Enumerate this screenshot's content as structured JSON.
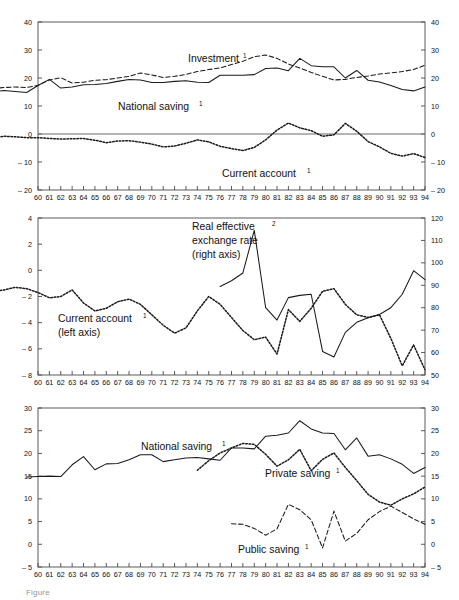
{
  "figure": {
    "caption": "Figure",
    "x_axis_tick_labels": [
      "60",
      "61",
      "62",
      "63",
      "64",
      "65",
      "66",
      "67",
      "68",
      "69",
      "70",
      "71",
      "72",
      "73",
      "74",
      "75",
      "76",
      "77",
      "78",
      "79",
      "80",
      "81",
      "82",
      "83",
      "84",
      "85",
      "86",
      "87",
      "88",
      "89",
      "90",
      "91",
      "92",
      "93",
      "94"
    ],
    "footnote_marker_1": "1",
    "footnote_marker_2": "2"
  },
  "chart_data": [
    {
      "type": "line",
      "panel": "top",
      "title": "",
      "xlabel": "",
      "ylabel": "",
      "x": [
        1960,
        1961,
        1962,
        1963,
        1964,
        1965,
        1966,
        1967,
        1968,
        1969,
        1970,
        1971,
        1972,
        1973,
        1974,
        1975,
        1976,
        1977,
        1978,
        1979,
        1980,
        1981,
        1982,
        1983,
        1984,
        1985,
        1986,
        1987,
        1988,
        1989,
        1990,
        1991,
        1992,
        1993,
        1994
      ],
      "xtick_labels": [
        "60",
        "61",
        "62",
        "63",
        "64",
        "65",
        "66",
        "67",
        "68",
        "69",
        "70",
        "71",
        "72",
        "73",
        "74",
        "75",
        "76",
        "77",
        "78",
        "79",
        "80",
        "81",
        "82",
        "83",
        "84",
        "85",
        "86",
        "87",
        "88",
        "89",
        "90",
        "91",
        "92",
        "93",
        "94"
      ],
      "ylim": [
        -20,
        40
      ],
      "yticks": [
        -20,
        -10,
        0,
        10,
        20,
        30,
        40
      ],
      "ytick_labels": [
        "– 20",
        "– 10",
        "0",
        "10",
        "20",
        "30",
        "40"
      ],
      "right_axis_yticks": [
        -20,
        -10,
        0,
        10,
        20,
        30,
        40
      ],
      "right_axis_tick_labels": [
        "– 20",
        "– 10",
        "0",
        "10",
        "20",
        "30",
        "40"
      ],
      "grid": false,
      "zero_line": true,
      "series": [
        {
          "name": "Investment",
          "label": "Investment",
          "label_superscript": "1",
          "style": "dashed",
          "color": "#1a1a1a",
          "values": [
            16.2,
            16.6,
            16.8,
            16.6,
            17.4,
            19.3,
            20.1,
            18.2,
            18.5,
            19.2,
            19.4,
            20.0,
            20.6,
            21.8,
            21.1,
            20.2,
            20.6,
            21.3,
            22.3,
            23.0,
            23.6,
            24.8,
            26.0,
            27.6,
            28.2,
            27.0,
            25.0,
            23.6,
            22.0,
            20.6,
            19.3,
            19.5,
            20.2,
            20.7,
            21.4,
            21.8,
            22.3,
            23.0,
            24.6
          ]
        },
        {
          "name": "National saving",
          "label": "National saving",
          "label_superscript": "1",
          "style": "solid",
          "color": "#1a1a1a",
          "values": [
            14.9,
            15.1,
            15.5,
            15.2,
            14.8,
            17.3,
            19.5,
            16.4,
            16.8,
            17.6,
            17.7,
            18.0,
            18.8,
            19.5,
            19.3,
            18.4,
            18.4,
            18.8,
            19.0,
            18.5,
            18.4,
            21.0,
            21.0,
            21.0,
            21.2,
            23.4,
            23.6,
            22.6,
            27.0,
            24.4,
            24.0,
            24.0,
            20.0,
            22.7,
            19.2,
            18.6,
            17.3,
            15.9,
            15.4,
            16.8
          ]
        },
        {
          "name": "Current account",
          "label": "Current account",
          "label_superscript": "1",
          "style": "dotted",
          "color": "#1a1a1a",
          "values": [
            -2.2,
            -2.0,
            -1.8,
            -1.4,
            -0.8,
            -1.0,
            -1.3,
            -1.3,
            -1.6,
            -1.8,
            -1.7,
            -1.6,
            -2.2,
            -3.1,
            -2.5,
            -2.4,
            -2.9,
            -3.6,
            -4.6,
            -4.3,
            -3.3,
            -2.1,
            -2.8,
            -4.4,
            -5.2,
            -5.9,
            -4.8,
            -2.1,
            1.4,
            3.9,
            2.2,
            1.2,
            -0.8,
            -0.3,
            3.8,
            1.0,
            -2.7,
            -4.6,
            -6.9,
            -7.9,
            -7.0,
            -8.4
          ]
        }
      ]
    },
    {
      "type": "line",
      "panel": "middle",
      "title": "",
      "xlabel": "",
      "ylabel": "",
      "ylim": [
        -8,
        4
      ],
      "yticks": [
        -8,
        -6,
        -4,
        -2,
        0,
        2,
        4
      ],
      "ytick_labels": [
        "– 8",
        "– 6",
        "– 4",
        "– 2",
        "0",
        "2",
        "4"
      ],
      "right_ylim": [
        50,
        120
      ],
      "right_yticks": [
        50,
        60,
        70,
        80,
        90,
        100,
        110,
        120
      ],
      "right_ytick_labels": [
        "50",
        "60",
        "70",
        "80",
        "90",
        "100",
        "110",
        "120"
      ],
      "grid": false,
      "series": [
        {
          "name": "Current account (left axis)",
          "label": "Current account",
          "label_line2": "(left axis)",
          "label_superscript": "1",
          "axis": "left",
          "style": "dotted",
          "color": "#1a1a1a",
          "values": [
            -2.2,
            -1.6,
            -1.1,
            -0.8,
            -1.0,
            -1.3,
            -1.6,
            -1.5,
            -1.3,
            -1.4,
            -1.7,
            -2.1,
            -2.0,
            -1.5,
            -2.5,
            -3.1,
            -2.9,
            -2.4,
            -2.2,
            -2.6,
            -3.4,
            -4.2,
            -4.8,
            -4.4,
            -3.1,
            -2.0,
            -2.6,
            -3.6,
            -4.6,
            -5.3,
            -5.1,
            -6.4,
            -3.0,
            -3.9,
            -2.9,
            -1.6,
            -1.4,
            -2.6,
            -3.4,
            -3.6,
            -3.4,
            -5.2,
            -7.3,
            -5.7,
            -7.6
          ]
        },
        {
          "name": "Real effective exchange rate (right axis)",
          "label_line1": "Real effective",
          "label_line2": "exchange rate",
          "label_line3": "(right axis)",
          "label_superscript": "2",
          "axis": "right",
          "style": "solid",
          "color": "#1a1a1a",
          "values": [
            89.5,
            92.0,
            95.5,
            114.5,
            80.0,
            74.5,
            84.5,
            85.5,
            86.0,
            60.5,
            58.0,
            69.0,
            73.5,
            75.5,
            77.0,
            80.0,
            86.0,
            96.5,
            92.5
          ]
        }
      ]
    },
    {
      "type": "line",
      "panel": "bottom",
      "title": "",
      "xlabel": "",
      "ylabel": "",
      "ylim": [
        -5,
        30
      ],
      "yticks": [
        -5,
        0,
        5,
        10,
        15,
        20,
        25,
        30
      ],
      "ytick_labels": [
        "– 5",
        "0",
        "5",
        "10",
        "15",
        "20",
        "25",
        "30"
      ],
      "right_yticks": [
        -5,
        0,
        5,
        10,
        15,
        20,
        25,
        30
      ],
      "right_ytick_labels": [
        "– 5",
        "0",
        "5",
        "10",
        "15",
        "20",
        "25",
        "30"
      ],
      "grid": false,
      "series": [
        {
          "name": "National saving",
          "label": "National saving",
          "label_superscript": "1",
          "style": "solid",
          "color": "#1a1a1a",
          "values": [
            14.8,
            14.9,
            15.0,
            14.9,
            17.5,
            19.3,
            16.4,
            17.7,
            17.8,
            18.6,
            19.7,
            19.7,
            18.2,
            18.6,
            19.0,
            19.1,
            18.8,
            18.5,
            21.2,
            21.2,
            21.0,
            23.8,
            24.0,
            24.5,
            27.2,
            25.4,
            24.5,
            24.4,
            20.8,
            23.4,
            19.4,
            19.7,
            18.8,
            17.6,
            15.6,
            16.9
          ]
        },
        {
          "name": "Private saving",
          "label": "Private saving",
          "label_superscript": "1",
          "style": "dotted",
          "color": "#1a1a1a",
          "values": [
            16.3,
            18.4,
            20.1,
            21.2,
            22.2,
            22.0,
            19.8,
            17.2,
            18.6,
            20.9,
            16.2,
            18.7,
            20.1,
            16.9,
            14.0,
            11.0,
            9.3,
            8.6,
            10.0,
            11.1,
            12.6
          ]
        },
        {
          "name": "Public saving",
          "label": "Public saving",
          "label_superscript": "1",
          "style": "dashed",
          "color": "#1a1a1a",
          "values": [
            4.5,
            4.4,
            3.5,
            2.0,
            3.4,
            8.8,
            7.6,
            5.4,
            -0.8,
            7.3,
            0.7,
            2.4,
            5.4,
            7.2,
            8.4,
            7.0,
            5.6,
            4.4
          ]
        }
      ]
    }
  ]
}
